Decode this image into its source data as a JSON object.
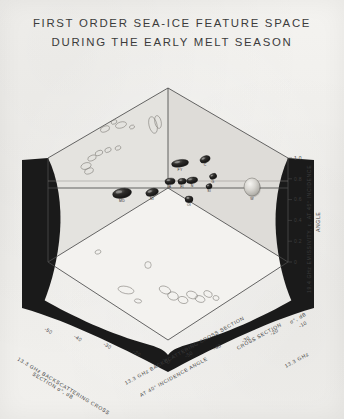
{
  "figure": {
    "title_lines": [
      "FIRST ORDER SEA-ICE FEATURE SPACE",
      "DURING THE EARLY MELT SEASON"
    ],
    "background_color": "#f2f1ee",
    "ink_color": "#3d3d3d",
    "panel_fill": "#e2e1dd",
    "curtain_color": "#1a1a1a"
  },
  "chart_data": {
    "type": "scatter",
    "title": "FIRST ORDER SEA-ICE FEATURE SPACE DURING THE EARLY MELT SEASON",
    "subtitle": "",
    "projection": "3d-box",
    "grid": false,
    "legend": "none",
    "axes": {
      "left": {
        "label": "13.3 GHz BACKSCATTERING CROSS SECTION σ°, dB",
        "ticks": [
          "-50",
          "-40",
          "-30",
          "-20",
          "-10"
        ],
        "range": [
          -50,
          -10
        ],
        "units": "dB"
      },
      "bottom_right": {
        "label": "13.3 GHz BACKSCATTERING CROSS SECTION AT 40° INCIDENCE ANGLE σ°, dB",
        "label_line1": "13.3 GHz BACKSCATTERING CROSS SECTION",
        "label_line2": "AT 40° INCIDENCE ANGLE",
        "label_tail": "σ°, dB",
        "ticks": [
          "-50",
          "-40",
          "-30",
          "-20",
          "-10"
        ],
        "range": [
          -50,
          -10
        ],
        "units": "dB"
      },
      "right": {
        "label": "19.4 GHz EMISSIVITY, ε, AT 45° INCIDENCE ANGLE",
        "label_line1": "19.4 GHz EMISSIVITY, ε, AT 45° INCIDENCE",
        "label_line2": "ANGLE",
        "ticks": [
          "1.0",
          "0.8",
          "0.6",
          "0.4",
          "0.2",
          "0"
        ],
        "range": [
          0,
          1.0
        ],
        "units": ""
      }
    },
    "clusters": [
      {
        "id": "FY",
        "label": "FY",
        "style": "filled",
        "cx": 180,
        "cy": 163,
        "rx": 8.5,
        "ry": 3.4,
        "rot": -8
      },
      {
        "id": "C",
        "label": "C",
        "style": "filled",
        "cx": 205,
        "cy": 159,
        "rx": 5.2,
        "ry": 3.0,
        "rot": -22
      },
      {
        "id": "B",
        "label": "B",
        "style": "filled",
        "cx": 170,
        "cy": 181,
        "rx": 5.0,
        "ry": 2.8,
        "rot": -6
      },
      {
        "id": "FI",
        "label": "FI",
        "style": "filled",
        "cx": 182,
        "cy": 181,
        "rx": 4.1,
        "ry": 2.6,
        "rot": -6
      },
      {
        "id": "N",
        "label": "N",
        "style": "filled",
        "cx": 192,
        "cy": 180,
        "rx": 5.6,
        "ry": 2.8,
        "rot": -10
      },
      {
        "id": "G",
        "label": "G",
        "style": "filled",
        "cx": 213,
        "cy": 176,
        "rx": 3.6,
        "ry": 2.4,
        "rot": -20
      },
      {
        "id": "SI",
        "label": "SI",
        "style": "filled",
        "cx": 209,
        "cy": 186,
        "rx": 3.0,
        "ry": 2.2,
        "rot": -18
      },
      {
        "id": "MD",
        "label": "MD",
        "style": "filled",
        "cx": 122,
        "cy": 193,
        "rx": 9.5,
        "ry": 4.6,
        "rot": -10
      },
      {
        "id": "NI",
        "label": "NI",
        "style": "filled",
        "cx": 152,
        "cy": 192,
        "rx": 6.4,
        "ry": 3.4,
        "rot": -16
      },
      {
        "id": "OI",
        "label": "OI",
        "style": "filled",
        "cx": 189,
        "cy": 199,
        "rx": 4.0,
        "ry": 3.0,
        "rot": 0
      },
      {
        "id": "W",
        "label": "W",
        "style": "sphere",
        "cx": 252,
        "cy": 187,
        "rx": 8.0,
        "ry": 9.0,
        "rot": 0
      }
    ],
    "wall_projections": [
      {
        "cx": 97,
        "cy": 124,
        "rx": 4.2,
        "ry": 2.4,
        "rot": -22
      },
      {
        "cx": 105,
        "cy": 129,
        "rx": 4.8,
        "ry": 2.8,
        "rot": -20
      },
      {
        "cx": 114,
        "cy": 122,
        "rx": 3.0,
        "ry": 2.0,
        "rot": -25
      },
      {
        "cx": 121,
        "cy": 125,
        "rx": 5.6,
        "ry": 3.0,
        "rot": -16
      },
      {
        "cx": 132,
        "cy": 127,
        "rx": 2.6,
        "ry": 1.8,
        "rot": -20
      },
      {
        "cx": 111,
        "cy": 113,
        "rx": 2.8,
        "ry": 1.9,
        "rot": -28
      },
      {
        "cx": 153,
        "cy": 125,
        "rx": 4.0,
        "ry": 8.5,
        "rot": -14
      },
      {
        "cx": 158,
        "cy": 122,
        "rx": 3.2,
        "ry": 6.5,
        "rot": -12
      },
      {
        "cx": 92,
        "cy": 158,
        "rx": 4.4,
        "ry": 2.6,
        "rot": -22
      },
      {
        "cx": 99,
        "cy": 153,
        "rx": 4.0,
        "ry": 2.4,
        "rot": -24
      },
      {
        "cx": 108,
        "cy": 150,
        "rx": 3.4,
        "ry": 2.2,
        "rot": -24
      },
      {
        "cx": 118,
        "cy": 148,
        "rx": 3.0,
        "ry": 2.0,
        "rot": -22
      },
      {
        "cx": 86,
        "cy": 166,
        "rx": 5.2,
        "ry": 3.2,
        "rot": -18
      },
      {
        "cx": 89,
        "cy": 171,
        "rx": 4.6,
        "ry": 2.8,
        "rot": -18
      }
    ],
    "floor_projections": [
      {
        "cx": 148,
        "cy": 265,
        "rx": 3.2,
        "ry": 3.4,
        "rot": 0
      },
      {
        "cx": 126,
        "cy": 290,
        "rx": 8.0,
        "ry": 3.6,
        "rot": 12
      },
      {
        "cx": 138,
        "cy": 301,
        "rx": 3.6,
        "ry": 2.0,
        "rot": 10
      },
      {
        "cx": 165,
        "cy": 290,
        "rx": 6.0,
        "ry": 3.6,
        "rot": 22
      },
      {
        "cx": 173,
        "cy": 296,
        "rx": 5.4,
        "ry": 4.0,
        "rot": 18
      },
      {
        "cx": 183,
        "cy": 300,
        "rx": 5.0,
        "ry": 3.4,
        "rot": 16
      },
      {
        "cx": 192,
        "cy": 295,
        "rx": 5.6,
        "ry": 3.6,
        "rot": 20
      },
      {
        "cx": 200,
        "cy": 299,
        "rx": 5.0,
        "ry": 3.2,
        "rot": 18
      },
      {
        "cx": 208,
        "cy": 294,
        "rx": 4.4,
        "ry": 3.0,
        "rot": 22
      },
      {
        "cx": 216,
        "cy": 298,
        "rx": 3.0,
        "ry": 2.4,
        "rot": 14
      },
      {
        "cx": 98,
        "cy": 252,
        "rx": 3.0,
        "ry": 2.0,
        "rot": -18
      }
    ]
  }
}
